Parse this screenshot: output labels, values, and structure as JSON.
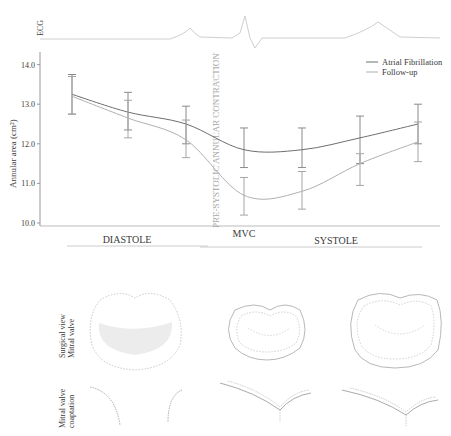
{
  "ecg": {
    "label": "ECG"
  },
  "chart_data": {
    "type": "line",
    "title": "",
    "xlabel": "",
    "ylabel": "Annular area (cm²)",
    "ylim": [
      10.0,
      14.0
    ],
    "yticks": [
      "10.0",
      "11.0",
      "12.0",
      "13.0",
      "14.0"
    ],
    "grid": false,
    "legend_position": "top-right",
    "x": [
      1,
      2,
      3,
      4,
      5,
      6,
      7
    ],
    "phase_labels": {
      "diastole": "DIASTOLE",
      "mvc": "MVC",
      "systole": "SYSTOLE"
    },
    "annotation": "PRE-SYSTOLIC ANNULAR CONTRACTION",
    "series": [
      {
        "name": "Atrial Fibrillation",
        "color": "#6e6e6e",
        "values": [
          13.25,
          12.8,
          12.5,
          11.85,
          11.85,
          12.15,
          12.5
        ],
        "error_low": [
          12.75,
          12.35,
          12.0,
          11.4,
          11.4,
          11.5,
          12.0
        ],
        "error_high": [
          13.75,
          13.3,
          12.95,
          12.4,
          12.4,
          12.7,
          13.0
        ]
      },
      {
        "name": "Follow-up",
        "color": "#b0b0b0",
        "values": [
          13.2,
          12.65,
          12.1,
          10.7,
          10.8,
          11.5,
          12.05
        ],
        "error_low": [
          12.75,
          12.15,
          11.65,
          10.2,
          10.35,
          10.95,
          11.55
        ],
        "error_high": [
          13.7,
          13.1,
          12.6,
          11.15,
          11.3,
          11.75,
          12.55
        ]
      }
    ]
  },
  "bottom": {
    "row1_label_line1": "Surgical view",
    "row1_label_line2": "Mitral valve",
    "row2_label_line1": "Mitral valve",
    "row2_label_line2": "coaptation"
  }
}
